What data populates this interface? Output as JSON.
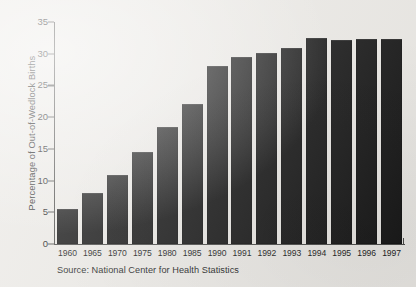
{
  "chart_data": {
    "type": "bar",
    "title": "",
    "subtitle": "",
    "xlabel": "",
    "ylabel": "Percentage of Out-of-Wedlock Births",
    "categories": [
      "1960",
      "1965",
      "1970",
      "1975",
      "1980",
      "1985",
      "1990",
      "1991",
      "1992",
      "1993",
      "1994",
      "1995",
      "1996",
      "1997"
    ],
    "values": [
      5.5,
      8.0,
      10.8,
      14.5,
      18.4,
      22.0,
      28.0,
      29.5,
      30.1,
      30.9,
      32.5,
      32.2,
      32.3,
      32.3
    ],
    "ylim": [
      0,
      35
    ],
    "yticks": [
      0,
      5,
      10,
      15,
      20,
      25,
      30,
      35
    ],
    "ytick_labels": [
      "0",
      "5",
      "10",
      "15",
      "20",
      "25",
      "30",
      "35"
    ],
    "grid": false,
    "legend": false,
    "legend_position": "none",
    "bar_color": "#161616",
    "axis_color": "#4a4a48",
    "background_color": "#eceae6",
    "series": [
      {
        "name": "Percentage of Out-of-Wedlock Births",
        "values": [
          5.5,
          8.0,
          10.8,
          14.5,
          18.4,
          22.0,
          28.0,
          29.5,
          30.1,
          30.9,
          32.5,
          32.2,
          32.3,
          32.3
        ]
      }
    ]
  },
  "caption": {
    "source": "Source: National Center for Health Statistics"
  }
}
